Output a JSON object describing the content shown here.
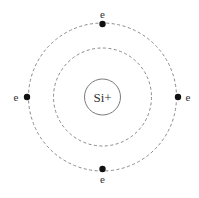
{
  "diagram": {
    "type": "bohr-atom-model",
    "nucleus": {
      "label": "Si+",
      "cx": 102.5,
      "cy": 97,
      "r": 18
    },
    "orbits": [
      {
        "name": "inner-orbit",
        "r": 49,
        "style": "dashed"
      },
      {
        "name": "outer-orbit",
        "r": 74,
        "style": "dashed"
      }
    ],
    "electrons": [
      {
        "label": "e",
        "position": "top",
        "x": 102.5,
        "y": 24,
        "label_x": 102.5,
        "label_y": 17
      },
      {
        "label": "e",
        "position": "left",
        "x": 27,
        "y": 97,
        "label_x": 16,
        "label_y": 101
      },
      {
        "label": "e",
        "position": "right",
        "x": 178,
        "y": 97,
        "label_x": 188,
        "label_y": 101
      },
      {
        "label": "e",
        "position": "bottom",
        "x": 102.5,
        "y": 169,
        "label_x": 102.5,
        "label_y": 184
      }
    ],
    "colors": {
      "orbit": "#8a8a8a",
      "nucleus_stroke": "#7a7a7a",
      "electron": "#111111",
      "text": "#333333"
    }
  }
}
